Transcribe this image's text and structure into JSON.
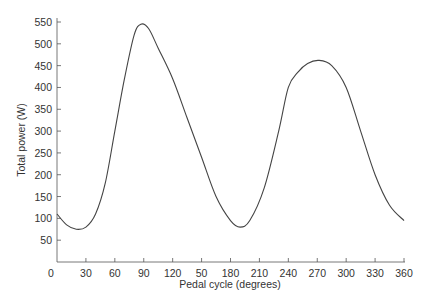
{
  "chart_data": {
    "type": "line",
    "title": "",
    "xlabel": "Pedal cycle (degrees)",
    "ylabel": "Total power (W)",
    "xlim": [
      0,
      360
    ],
    "ylim": [
      0,
      550
    ],
    "grid": false,
    "legend": null,
    "x_ticks": [
      0,
      30,
      60,
      90,
      120,
      150,
      180,
      210,
      240,
      270,
      300,
      330,
      360
    ],
    "x_tick_labels": [
      "0",
      "30",
      "60",
      "90",
      "120",
      "50",
      "180",
      "210",
      "240",
      "270",
      "300",
      "330",
      "360"
    ],
    "y_ticks": [
      50,
      100,
      150,
      200,
      250,
      300,
      350,
      400,
      450,
      500,
      550
    ],
    "y_tick_labels": [
      "50",
      "100",
      "150",
      "200",
      "250",
      "300",
      "350",
      "400",
      "450",
      "500",
      "550"
    ],
    "series": [
      {
        "name": "Total power",
        "color": "#444444",
        "x": [
          0,
          10,
          20,
          30,
          40,
          50,
          60,
          70,
          80,
          87,
          95,
          105,
          120,
          135,
          150,
          165,
          180,
          190,
          200,
          215,
          230,
          240,
          250,
          260,
          272,
          285,
          300,
          315,
          330,
          345,
          360
        ],
        "y": [
          110,
          85,
          75,
          80,
          110,
          180,
          300,
          420,
          520,
          545,
          535,
          490,
          420,
          330,
          240,
          150,
          95,
          80,
          95,
          170,
          300,
          400,
          435,
          455,
          462,
          450,
          400,
          300,
          200,
          130,
          95
        ]
      }
    ]
  }
}
